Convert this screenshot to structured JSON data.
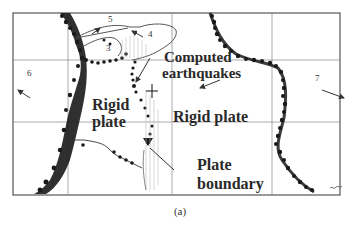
{
  "figure": {
    "caption": "(a)",
    "labels": {
      "computed_earthquakes_line1": "Computed",
      "computed_earthquakes_line2": "earthquakes",
      "rigid_plate_left_line1": "Rigid",
      "rigid_plate_left_line2": "plate",
      "rigid_plate_right": "Rigid plate",
      "plate_boundary_line1": "Plate",
      "plate_boundary_line2": "boundary"
    },
    "region_numbers": [
      "3",
      "4",
      "5",
      "6",
      "7"
    ],
    "colors": {
      "frame": "#555555",
      "grid": "#777777",
      "earthquake_markers": "#1a1a1a",
      "text": "#2a2a2a",
      "background": "#ffffff"
    }
  }
}
